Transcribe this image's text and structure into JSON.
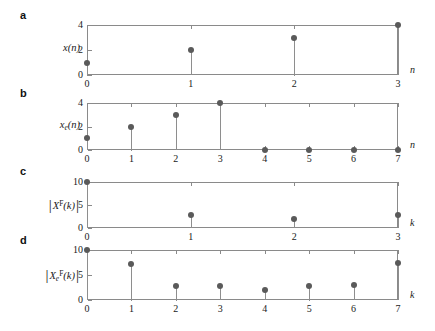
{
  "figure": {
    "background": "#ffffff",
    "marker_color": "#5a5a5a",
    "stem_color": "#8e8e8e",
    "axis_color": "#8a8a8a"
  },
  "panels": [
    {
      "letter": "a",
      "ylabel_parts": {
        "main": "x",
        "sub": "",
        "sup": "",
        "arg": "(n)",
        "bars": false
      },
      "xlabel": "n",
      "ytick_labels": [
        "0",
        "2",
        "4"
      ],
      "xtick_labels": [
        "0",
        "1",
        "2",
        "3"
      ]
    },
    {
      "letter": "b",
      "ylabel_parts": {
        "main": "x",
        "sub": "e",
        "sup": "",
        "arg": "(n)",
        "bars": false
      },
      "xlabel": "n",
      "ytick_labels": [
        "0",
        "2",
        "4"
      ],
      "xtick_labels": [
        "0",
        "1",
        "2",
        "3",
        "4",
        "5",
        "6",
        "7"
      ]
    },
    {
      "letter": "c",
      "ylabel_parts": {
        "main": "X",
        "sub": "",
        "sup": "F",
        "arg": "(k)",
        "bars": true
      },
      "xlabel": "k",
      "ytick_labels": [
        "0",
        "5",
        "10"
      ],
      "xtick_labels": [
        "0",
        "1",
        "2",
        "3"
      ]
    },
    {
      "letter": "d",
      "ylabel_parts": {
        "main": "X",
        "sub": "e",
        "sup": "F",
        "arg": "(k)",
        "bars": true
      },
      "xlabel": "k",
      "ytick_labels": [
        "0",
        "5",
        "10"
      ],
      "xtick_labels": [
        "0",
        "1",
        "2",
        "3",
        "4",
        "5",
        "6",
        "7"
      ]
    }
  ],
  "chart_data": [
    {
      "type": "bar",
      "panel": "a",
      "title": "x(n)",
      "xlabel": "n",
      "ylabel": "x(n)",
      "categories": [
        0,
        1,
        2,
        3
      ],
      "values": [
        1,
        2,
        3,
        4
      ],
      "xlim": [
        0,
        3
      ],
      "ylim": [
        0,
        4
      ],
      "yticks": [
        0,
        2,
        4
      ],
      "xticks": [
        0,
        1,
        2,
        3
      ],
      "grid": false,
      "legend": "none"
    },
    {
      "type": "bar",
      "panel": "b",
      "title": "x_e(n)",
      "xlabel": "n",
      "ylabel": "x_e(n)",
      "categories": [
        0,
        1,
        2,
        3,
        4,
        5,
        6,
        7
      ],
      "values": [
        1,
        2,
        3,
        4,
        0,
        0,
        0,
        0
      ],
      "xlim": [
        0,
        7
      ],
      "ylim": [
        0,
        4
      ],
      "yticks": [
        0,
        2,
        4
      ],
      "xticks": [
        0,
        1,
        2,
        3,
        4,
        5,
        6,
        7
      ],
      "grid": false,
      "legend": "none"
    },
    {
      "type": "bar",
      "panel": "c",
      "title": "|X^F(k)|",
      "xlabel": "k",
      "ylabel": "|X^F(k)|",
      "categories": [
        0,
        1,
        2,
        3
      ],
      "values": [
        10,
        2.83,
        2.0,
        2.83
      ],
      "xlim": [
        0,
        3
      ],
      "ylim": [
        0,
        10
      ],
      "yticks": [
        0,
        5,
        10
      ],
      "xticks": [
        0,
        1,
        2,
        3
      ],
      "grid": false,
      "legend": "none"
    },
    {
      "type": "bar",
      "panel": "d",
      "title": "|X_e^F(k)|",
      "xlabel": "k",
      "ylabel": "|X_e^F(k)|",
      "categories": [
        0,
        1,
        2,
        3,
        4,
        5,
        6,
        7
      ],
      "values": [
        10,
        7.3,
        2.9,
        2.8,
        2.0,
        2.9,
        3.0,
        7.4
      ],
      "xlim": [
        0,
        7
      ],
      "ylim": [
        0,
        10
      ],
      "yticks": [
        0,
        5,
        10
      ],
      "xticks": [
        0,
        1,
        2,
        3,
        4,
        5,
        6,
        7
      ],
      "grid": false,
      "legend": "none"
    }
  ]
}
